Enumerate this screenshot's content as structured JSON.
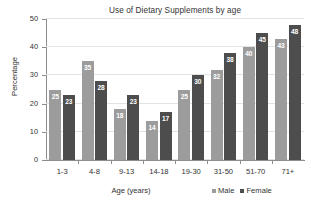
{
  "chart_data": {
    "type": "bar",
    "title": "Use of Dietary Supplements by age",
    "xlabel": "Age (years)",
    "ylabel": "Percentage",
    "categories": [
      "1-3",
      "4-8",
      "9-13",
      "14-18",
      "19-30",
      "31-50",
      "51-70",
      "71+"
    ],
    "series": [
      {
        "name": "Male",
        "color": "#9c9c9c",
        "values": [
          25,
          35,
          18,
          14,
          25,
          32,
          40,
          43
        ]
      },
      {
        "name": "Female",
        "color": "#4d4d4d",
        "values": [
          23,
          28,
          23,
          17,
          30,
          38,
          45,
          48
        ]
      }
    ],
    "ylim": [
      0,
      50
    ],
    "yticks": [
      0,
      10,
      20,
      30,
      40,
      50
    ],
    "ytick_labels": [
      "0",
      "10",
      "20",
      "30",
      "40",
      "50"
    ],
    "grid": true,
    "legend_position": "bottom-right",
    "data_labels": true
  },
  "colors": {
    "male": "#9c9c9c",
    "female": "#4d4d4d",
    "axis": "#8d8d8d",
    "grid": "#e3e3e3",
    "text": "#333333",
    "background": "#ffffff"
  }
}
